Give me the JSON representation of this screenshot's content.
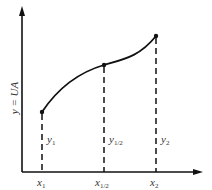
{
  "diagram": {
    "y_axis_label": "y = UA",
    "points": [
      {
        "name": "x1",
        "x_label": "x",
        "x_sub": "1",
        "y_label": "y",
        "y_sub": "1"
      },
      {
        "name": "x_half",
        "x_label": "x",
        "x_sub": "1/2",
        "y_label": "y",
        "y_sub": "1/2"
      },
      {
        "name": "x2",
        "x_label": "x",
        "x_sub": "2",
        "y_label": "y",
        "y_sub": "2"
      }
    ]
  }
}
